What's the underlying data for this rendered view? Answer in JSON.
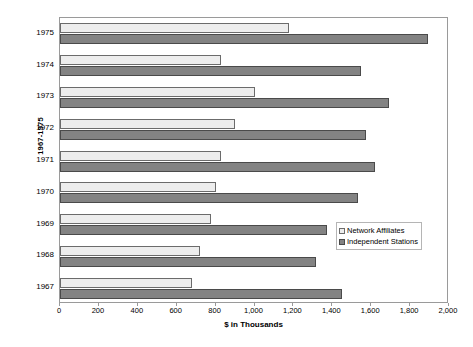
{
  "chart_data": {
    "type": "bar",
    "orientation": "horizontal",
    "title": "",
    "xlabel": "$ in Thousands",
    "ylabel": "1967-1975",
    "categories": [
      "1967",
      "1968",
      "1969",
      "1970",
      "1971",
      "1972",
      "1973",
      "1974",
      "1975"
    ],
    "xlim": [
      0,
      2000
    ],
    "xticks": [
      0,
      200,
      400,
      600,
      800,
      1000,
      1200,
      1400,
      1600,
      1800,
      2000
    ],
    "xticklabels": [
      "0",
      "200",
      "400",
      "600",
      "800",
      "1,000",
      "1,200",
      "1,400",
      "1,600",
      "1,800",
      "2,000"
    ],
    "grid": false,
    "legend_position": "right-center",
    "series": [
      {
        "name": "Network Affiliates",
        "color": "#ededed",
        "values": [
          680,
          720,
          775,
          800,
          830,
          900,
          1000,
          830,
          1175
        ]
      },
      {
        "name": "Independent Stations",
        "color": "#838383",
        "values": [
          1450,
          1315,
          1375,
          1530,
          1620,
          1575,
          1690,
          1550,
          1890
        ]
      }
    ]
  },
  "legend": {
    "items": [
      {
        "label": "Network Affiliates"
      },
      {
        "label": "Independent Stations"
      }
    ]
  }
}
